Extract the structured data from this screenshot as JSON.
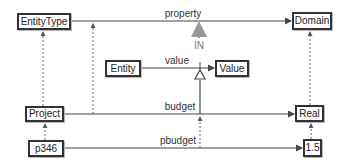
{
  "diagram": {
    "nodes": {
      "entity_type": "EntityType",
      "domain": "Domain",
      "entity": "Entity",
      "value": "Value",
      "project": "Project",
      "real": "Real",
      "p346": "p346",
      "one_point_five": "1.5"
    },
    "edges": {
      "property": "property",
      "value": "value",
      "budget": "budget",
      "pbudget": "pbudget",
      "in": "IN"
    },
    "colors": {
      "line": "#444444",
      "dotted": "#666666",
      "in_arrow": "#999999"
    }
  }
}
